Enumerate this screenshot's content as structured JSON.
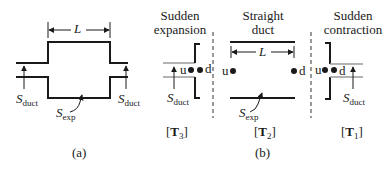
{
  "panel_a": {
    "caption": "(a)",
    "length_label": "L",
    "inlet_area": {
      "symbol": "S",
      "subscript": "duct"
    },
    "outlet_area": {
      "symbol": "S",
      "subscript": "duct"
    },
    "expansion_area": {
      "symbol": "S",
      "subscript": "exp"
    }
  },
  "panel_b": {
    "caption": "(b)",
    "sections": [
      {
        "title_line1": "Sudden",
        "title_line2": "expansion",
        "tag": "T",
        "tag_sub": "3",
        "upstream_label": "u",
        "downstream_label": "d",
        "area": {
          "symbol": "S",
          "subscript": "duct"
        }
      },
      {
        "title_line1": "Straight",
        "title_line2": "duct",
        "tag": "T",
        "tag_sub": "2",
        "upstream_label": "u",
        "downstream_label": "d",
        "length_label": "L",
        "area": {
          "symbol": "S",
          "subscript": "exp"
        }
      },
      {
        "title_line1": "Sudden",
        "title_line2": "contraction",
        "tag": "T",
        "tag_sub": "1",
        "upstream_label": "u",
        "downstream_label": "d",
        "area": {
          "symbol": "S",
          "subscript": "duct"
        }
      }
    ]
  },
  "colors": {
    "line": "#1a1a1a",
    "duct_gray": "#9a9a9a",
    "divider": "#555555"
  }
}
